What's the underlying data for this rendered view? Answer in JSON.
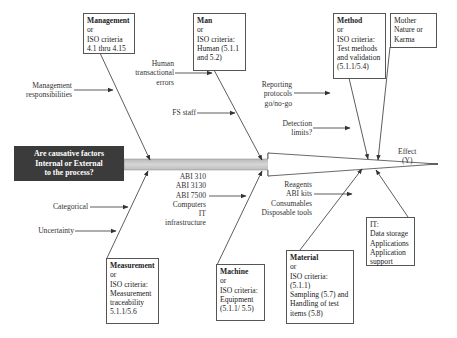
{
  "diagram": {
    "type": "fishbone",
    "question": [
      "Are causative factors",
      "Internal or External",
      "to the process?"
    ],
    "effect": [
      "Effect",
      "(Y)"
    ],
    "categories": {
      "management": {
        "title": "Management",
        "lines": [
          "or",
          "ISO criteria",
          "4.1 thru 4.15"
        ],
        "causes": [
          [
            "Management",
            "responsibilities"
          ]
        ]
      },
      "man": {
        "title": "Man",
        "lines": [
          "or",
          "ISO criteria:",
          "Human (5.1.1",
          "and 5.2)"
        ],
        "causes": [
          [
            "Human",
            "transactional",
            "errors"
          ],
          [
            "FS staff"
          ]
        ]
      },
      "method": {
        "title": "Method",
        "lines": [
          "or",
          "ISO criteria:",
          "Test methods",
          "and validation",
          "(5.1.1/5.4)"
        ],
        "causes": [
          [
            "Reporting",
            "protocols",
            "go/no-go"
          ],
          [
            "Detection",
            "limits?"
          ]
        ]
      },
      "mother_nature": {
        "lines": [
          "Mother",
          "Nature or",
          "Karma"
        ]
      },
      "measurement": {
        "title": "Measurement",
        "lines": [
          "or",
          "ISO criteria:",
          "Measurement",
          "traceability",
          "5.1.1/5.6"
        ],
        "causes": [
          [
            "Categorical"
          ],
          [
            "Uncertainty"
          ]
        ]
      },
      "machine": {
        "title": "Machine",
        "lines": [
          "or",
          "ISO criteria:",
          "Equipment",
          "(5.1.1/ 5.5)"
        ],
        "causes": [
          [
            "ABI 310",
            "ABI 3130",
            "ABI 7500",
            "Computers",
            "IT",
            "infrastructure"
          ]
        ]
      },
      "material": {
        "title": "Material",
        "lines": [
          "or",
          "ISO criteria:",
          "(5.1.1)",
          "Sampling (5.7) and",
          "Handling of test",
          "items (5.8)"
        ],
        "causes": [
          [
            "Reagents",
            "ABI kits",
            "Consumables",
            "Disposable tools"
          ]
        ]
      },
      "it": {
        "lines": [
          "IT:",
          "Data storage",
          "Applications",
          "Application",
          "support"
        ]
      }
    },
    "colors": {
      "question_bg": "#3b3b3b",
      "spine_fill": "#c8c8c8",
      "line": "#333333"
    }
  }
}
